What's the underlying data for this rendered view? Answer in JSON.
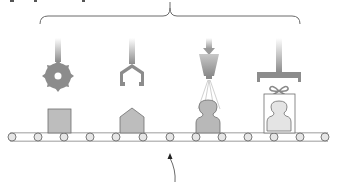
{
  "diagram": {
    "type": "assembly-line",
    "colors": {
      "background": "#ffffff",
      "machine_gray": "#8c8c8c",
      "machine_light": "#d8d8d8",
      "product_fill": "#bdbdbd",
      "product_stroke": "#6e6e6e",
      "belt_stroke": "#7a7a7a",
      "roller_fill": "#e6e6e6",
      "brace_stroke": "#6a6a6a",
      "arrow_stroke": "#444444"
    },
    "brace": {
      "spans": "all-stations",
      "x_start": 40,
      "x_end": 300,
      "y": 16
    },
    "stations": [
      {
        "id": 1,
        "tool": "saw-blade-cutter",
        "product": "square-block",
        "x": 58
      },
      {
        "id": 2,
        "tool": "claw-gripper",
        "product": "house-shaped-block",
        "x": 132
      },
      {
        "id": 3,
        "tool": "spray-nozzle",
        "product": "person-silhouette",
        "x": 209
      },
      {
        "id": 4,
        "tool": "press-stamp",
        "product": "gift-boxed-person",
        "x": 279
      }
    ],
    "conveyor": {
      "y": 137,
      "x_start": 6,
      "x_end": 330,
      "rollers": 9
    },
    "pointer_arrow": {
      "direction": "up",
      "target": "conveyor"
    }
  }
}
